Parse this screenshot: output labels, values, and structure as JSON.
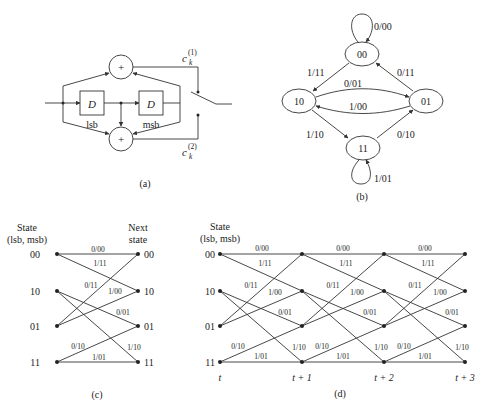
{
  "figure_a": {
    "caption": "(a)",
    "delay_label": "D",
    "register_labels": [
      "lsb",
      "msb"
    ],
    "adder_symbol": "+",
    "outputs": [
      {
        "name": "c",
        "sub": "k",
        "sup": "(1)"
      },
      {
        "name": "c",
        "sub": "k",
        "sup": "(2)"
      }
    ]
  },
  "figure_b": {
    "caption": "(b)",
    "states": [
      "00",
      "10",
      "01",
      "11"
    ],
    "transitions": [
      {
        "from": "00",
        "to": "00",
        "label": "0/00"
      },
      {
        "from": "00",
        "to": "10",
        "label": "1/11"
      },
      {
        "from": "10",
        "to": "01",
        "label": "0/01"
      },
      {
        "from": "01",
        "to": "10",
        "label": "1/00"
      },
      {
        "from": "01",
        "to": "00",
        "label": "0/11"
      },
      {
        "from": "10",
        "to": "11",
        "label": "1/10"
      },
      {
        "from": "11",
        "to": "01",
        "label": "0/10"
      },
      {
        "from": "11",
        "to": "11",
        "label": "1/01"
      }
    ]
  },
  "figure_c": {
    "caption": "(c)",
    "left_header": [
      "State",
      "(lsb, msb)"
    ],
    "right_header": [
      "Next",
      "state"
    ],
    "states": [
      "00",
      "10",
      "01",
      "11"
    ],
    "edge_labels": [
      "0/00",
      "1/11",
      "0/11",
      "1/00",
      "0/01",
      "0/10",
      "1/10",
      "1/01"
    ]
  },
  "figure_d": {
    "caption": "(d)",
    "header": [
      "State",
      "(lsb, msb)"
    ],
    "states": [
      "00",
      "10",
      "01",
      "11"
    ],
    "time_labels": [
      "t",
      "t + 1",
      "t + 2",
      "t + 3"
    ],
    "edge_labels": [
      "0/00",
      "1/11",
      "0/11",
      "1/00",
      "0/01",
      "0/10",
      "1/10",
      "1/01"
    ]
  }
}
